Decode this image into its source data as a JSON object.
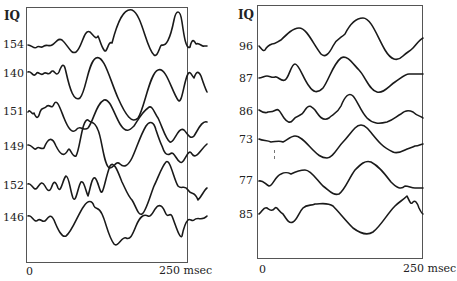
{
  "chart_data": [
    {
      "type": "line",
      "title": "",
      "group": "High IQ",
      "column_header": "IQ",
      "xlabel": "",
      "x_ticks": [
        "0",
        "250 msec"
      ],
      "xlim": [
        0,
        250
      ],
      "x_unit": "msec",
      "grid": false,
      "legend": "none",
      "series": [
        {
          "name": "154",
          "baseline_y": 45,
          "path": "M2,45 C6,45 8,50 11,47 C13,45 15,49 18,46 C21,44 23,47 26,45 C30,43 32,37 36,40 C42,45 45,55 50,52 C56,48 58,28 64,32 C68,36 70,40 72,36 C74,40 75,46 78,50 C81,55 82,40 86,43 C92,20 98,8 106,10 C116,14 120,48 128,55 C132,58 134,44 136,45 C140,46 144,40 148,20 C150,10 154,8 156,22 C158,36 160,50 164,47 C166,38 168,40 170,44 C173,42 176,47 178,46 C179,46 180,46 181,46"
        },
        {
          "name": "140",
          "baseline_y": 74,
          "path": "M2,72 C5,70 7,78 10,74 C12,70 14,76 17,74 C20,70 22,77 25,72 C28,68 30,78 33,72 C36,64 38,62 40,72 C44,90 48,102 54,98 C60,92 62,62 70,58 C78,54 84,80 92,98 C100,116 106,124 112,118 C118,110 124,72 132,70 C140,66 146,92 152,100 C156,106 158,80 162,74 C164,70 166,76 168,78 C170,72 172,70 175,76 C177,82 179,88 181,92"
        },
        {
          "name": "151",
          "baseline_y": 112,
          "path": "M2,112 C4,108 6,116 8,113 C10,118 12,120 14,112 C16,106 18,110 21,106 C24,104 26,110 28,104 C31,98 34,108 38,118 C42,128 46,134 50,130 C54,124 58,132 62,128 C68,120 70,104 78,100 C84,98 88,114 94,124 C100,134 104,130 108,126 C112,120 116,112 122,108 C126,104 128,112 132,118 C136,126 140,140 144,142 C148,144 152,126 158,130 C162,134 164,140 168,136 C172,130 176,120 181,122"
        },
        {
          "name": "149",
          "baseline_y": 147,
          "path": "M2,145 C6,144 8,152 11,148 C13,146 15,150 18,148 C22,138 26,136 30,146 C34,154 38,158 42,150 C44,146 46,158 50,156 C54,150 56,118 62,120 C66,124 68,120 72,130 C76,138 78,168 84,168 C88,168 90,160 94,164 C98,168 102,166 106,158 C110,150 114,136 120,126 C124,120 128,122 130,130 C132,136 134,142 136,146 C138,152 140,156 144,154 C148,150 150,160 154,162 C158,166 162,146 166,154 C170,160 174,150 181,144"
        },
        {
          "name": "152",
          "baseline_y": 186,
          "path": "M2,184 C5,182 8,192 11,188 C14,184 16,180 19,186 C22,192 24,192 26,186 C28,180 30,182 32,188 C35,194 37,178 40,176 C43,176 44,190 47,198 C50,204 52,186 55,182 C58,180 60,192 62,196 C64,190 66,176 69,178 C72,180 74,194 76,192 C78,190 80,176 84,166 C88,160 92,172 96,182 C100,190 102,196 106,200 C110,206 112,216 116,214 C120,212 124,196 128,186 C132,178 136,166 140,162 C144,158 148,180 152,186 C156,190 158,184 162,190 C166,196 168,190 172,200 C176,196 178,190 181,188"
        },
        {
          "name": "146",
          "baseline_y": 218,
          "path": "M2,216 C6,214 8,224 12,220 C15,218 17,224 20,220 C23,216 25,214 28,220 C32,230 36,238 40,236 C46,232 52,214 58,206 C62,200 66,200 68,206 C70,210 72,206 76,214 C80,222 82,236 88,244 C92,248 96,236 100,238 C104,240 106,236 110,226 C114,216 118,214 122,216 C126,218 128,208 132,206 C136,204 138,210 140,214 C142,218 144,212 146,216 C150,226 154,240 156,236 C158,226 160,222 162,220 C164,218 166,222 168,220 C172,216 176,222 181,216"
        }
      ]
    },
    {
      "type": "line",
      "title": "",
      "group": "Low IQ",
      "column_header": "IQ",
      "xlabel": "",
      "x_ticks": [
        "0",
        "250 msec"
      ],
      "xlim": [
        0,
        250
      ],
      "x_unit": "msec",
      "grid": false,
      "legend": "none",
      "series": [
        {
          "name": "96",
          "baseline_y": 47,
          "path": "M2,46 C4,48 6,52 8,50 C10,46 12,45 15,44 C18,44 20,42 24,40 C30,34 36,28 42,28 C50,28 56,44 64,54 C68,58 72,54 76,46 C80,38 84,38 88,34 C94,22 100,18 106,18 C114,18 120,36 128,50 C134,60 140,62 146,56 C150,52 152,52 156,48 C160,44 162,40 166,38"
        },
        {
          "name": "87",
          "baseline_y": 79,
          "path": "M2,78 C5,78 7,76 10,76 C13,76 15,78 18,77 C21,76 24,82 28,80 C32,78 34,64 38,64 C42,64 46,78 52,86 C56,92 60,94 66,88 C72,80 76,64 84,58 C90,54 96,64 102,70 C108,76 112,90 120,92 C126,94 132,86 138,82 C144,78 148,74 152,74 C158,74 162,74 166,74"
        },
        {
          "name": "86",
          "baseline_y": 112,
          "path": "M2,110 C5,112 8,114 11,112 C14,112 16,112 19,110 C22,108 24,114 27,118 C30,122 33,124 36,120 C40,114 44,118 48,110 C52,104 54,106 58,110 C62,116 66,122 72,118 C76,114 80,114 84,106 C88,96 92,92 96,96 C100,100 104,112 110,118 C116,124 122,124 130,122 C136,120 140,116 144,114 C148,110 152,110 156,112 C160,116 164,116 166,118"
        },
        {
          "name": "73",
          "baseline_y": 140,
          "path": "M2,139 C6,141 10,140 14,142 C18,142 22,140 26,142 C30,140 34,136 38,136 C44,136 50,144 56,150 C60,154 64,158 70,158 C76,158 80,148 86,142 C90,138 94,132 98,128 C102,124 106,124 110,128 C114,132 118,138 124,144 C128,148 132,150 136,152 C140,154 144,152 148,150 C152,148 154,148 158,146 C162,146 164,144 166,144"
        },
        {
          "name": "77",
          "baseline_y": 181,
          "path": "M2,181 C6,180 8,184 12,186 C16,186 18,176 24,174 C28,172 30,172 34,174 C38,172 42,170 48,170 C54,170 60,180 66,186 C72,190 76,196 82,194 C88,190 92,178 98,170 C104,164 108,160 114,162 C122,166 128,174 134,182 C140,188 144,190 148,186 C152,186 154,188 158,188 C162,188 164,188 166,188"
        },
        {
          "name": "85",
          "baseline_y": 215,
          "path": "M2,214 C5,212 7,206 10,208 C13,210 15,212 18,208 C20,206 22,212 26,214 C30,220 32,224 36,222 C40,220 42,212 46,208 C50,204 54,206 58,204 C64,204 70,202 76,206 C82,212 88,220 96,228 C104,234 110,236 116,232 C124,226 130,214 138,206 C142,202 146,200 150,196 C152,200 154,206 156,202 C158,200 160,202 162,208 C164,212 165,214 166,214"
        }
      ]
    }
  ],
  "panels": [
    {
      "header": "IQ",
      "labels": [
        "154",
        "140",
        "151",
        "149",
        "152",
        "146"
      ],
      "x_start": "0",
      "x_end": "250 msec"
    },
    {
      "header": "IQ",
      "labels": [
        "96",
        "87",
        "86",
        "73",
        "77",
        "85"
      ],
      "x_start": "0",
      "x_end": "250 msec"
    }
  ]
}
